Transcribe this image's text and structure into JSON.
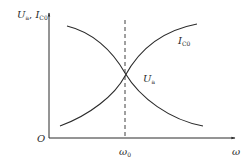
{
  "diagram": {
    "type": "line",
    "y_axis_label": {
      "base": "U",
      "sub": "a",
      "sep": ", ",
      "base2": "I",
      "sub2": "C0"
    },
    "x_axis_label": "ω",
    "origin_label": "O",
    "marker": {
      "label_base": "ω",
      "label_sub": "0",
      "style": "dashed"
    },
    "curves": [
      {
        "name": "I_C0",
        "label_base": "I",
        "label_sub": "C0",
        "trend": "increasing"
      },
      {
        "name": "U_a",
        "label_base": "U",
        "label_sub": "a",
        "trend": "decreasing"
      }
    ],
    "colors": {
      "line": "#2a2a2a",
      "background": "#ffffff"
    }
  }
}
